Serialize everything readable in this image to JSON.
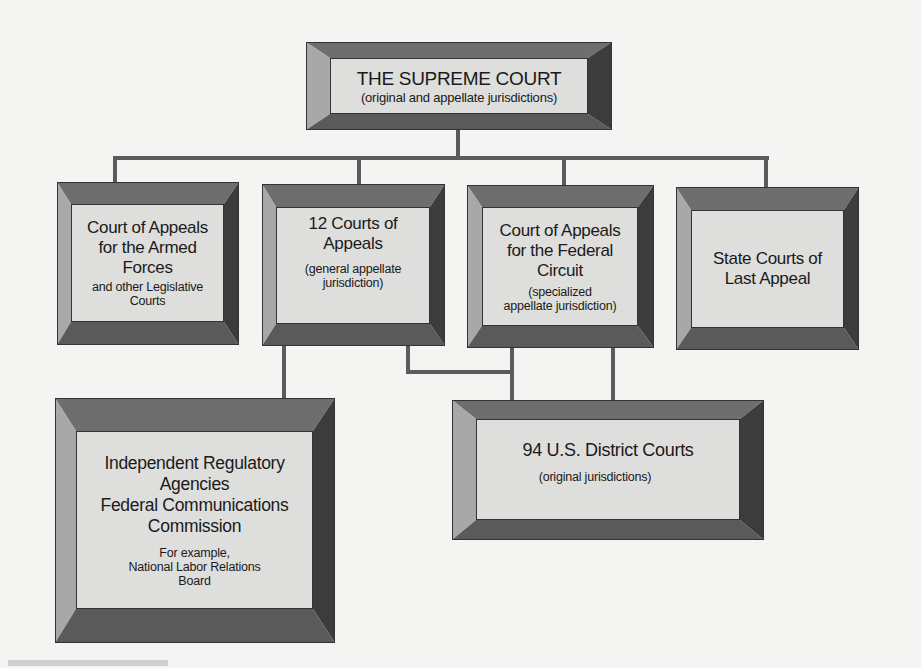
{
  "diagram": {
    "type": "org-chart",
    "nodes": {
      "supreme_court": {
        "title": "THE SUPREME COURT",
        "subtitle": "(original and appellate jurisdictions)"
      },
      "armed_forces": {
        "title": "Court of Appeals for the Armed Forces",
        "title_lines": [
          "Court of  Appeals",
          "for the Armed",
          "Forces"
        ],
        "subtitle_lines": [
          "and other Legislative",
          "Courts"
        ]
      },
      "courts_of_appeals": {
        "title_lines": [
          "12 Courts of",
          "Appeals"
        ],
        "subtitle_lines": [
          "(general appellate",
          "jurisdiction)"
        ]
      },
      "federal_circuit": {
        "title_lines": [
          "Court of Appeals",
          "for the Federal",
          "Circuit"
        ],
        "subtitle_lines": [
          "(specialized",
          "appellate jurisdiction)"
        ]
      },
      "state_courts": {
        "title_lines": [
          "State Courts of",
          "Last Appeal"
        ]
      },
      "regulatory_agencies": {
        "title_lines": [
          "Independent Regulatory",
          "Agencies",
          "Federal Communications",
          "Commission"
        ],
        "subtitle_lines": [
          "For example,",
          "National Labor Relations",
          "Board"
        ]
      },
      "district_courts": {
        "title": "94 U.S. District Courts",
        "subtitle": "(original jurisdictions)"
      }
    },
    "edges": [
      [
        "supreme_court",
        "armed_forces"
      ],
      [
        "supreme_court",
        "courts_of_appeals"
      ],
      [
        "supreme_court",
        "federal_circuit"
      ],
      [
        "supreme_court",
        "state_courts"
      ],
      [
        "courts_of_appeals",
        "regulatory_agencies"
      ],
      [
        "courts_of_appeals",
        "district_courts"
      ],
      [
        "federal_circuit",
        "district_courts"
      ]
    ],
    "colors": {
      "background": "#f4f4f2",
      "face": "#dededc",
      "bevel_top": "#6e6e6e",
      "bevel_left": "#a8a8a8",
      "bevel_right": "#3c3c3c",
      "bevel_bottom": "#5a5a5a",
      "connector": "#5b5b5b"
    }
  }
}
